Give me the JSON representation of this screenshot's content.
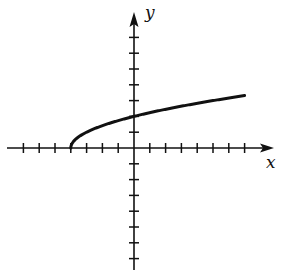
{
  "chart_data": {
    "type": "line",
    "title": "",
    "xlabel": "x",
    "ylabel": "y",
    "function": "y = sqrt(x + 4)",
    "xlim": [
      -8,
      8.5
    ],
    "ylim": [
      -8,
      8.5
    ],
    "x_ticks": [
      -7,
      -6,
      -5,
      -4,
      -3,
      -2,
      -1,
      1,
      2,
      3,
      4,
      5,
      6,
      7
    ],
    "y_ticks": [
      -7,
      -6,
      -5,
      -4,
      -3,
      -2,
      -1,
      1,
      2,
      3,
      4,
      5,
      6,
      7
    ],
    "tick_labels_shown": false,
    "grid": false,
    "legend": null,
    "series": [
      {
        "name": "curve",
        "x": [
          -4,
          -3.75,
          -3.5,
          -3,
          -2,
          -1,
          0,
          1,
          2,
          3,
          4,
          5,
          6,
          7
        ],
        "values": [
          0,
          0.5,
          0.707,
          1,
          1.414,
          1.732,
          2,
          2.236,
          2.449,
          2.646,
          2.828,
          3,
          3.162,
          3.317
        ]
      }
    ],
    "annotations": {
      "start_point": [
        -4,
        0
      ],
      "y_intercept": [
        0,
        2
      ],
      "end_point": [
        7,
        3.317
      ]
    }
  },
  "labels": {
    "x_axis": "x",
    "y_axis": "y"
  },
  "colors": {
    "axis": "#111111",
    "curve": "#111111",
    "background": "#ffffff"
  }
}
